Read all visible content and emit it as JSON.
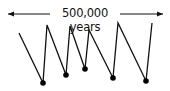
{
  "diagram": {
    "span_label": "500,000 years",
    "arrow": {
      "x1": 8,
      "x2": 163,
      "y": 14
    },
    "line_color": "#111111",
    "polyline": [
      [
        19,
        33
      ],
      [
        43,
        83
      ],
      [
        47,
        25
      ],
      [
        66,
        75
      ],
      [
        70,
        26
      ],
      [
        85,
        69
      ],
      [
        89,
        30
      ],
      [
        113,
        78
      ],
      [
        118,
        23
      ],
      [
        146,
        81
      ],
      [
        152,
        23
      ]
    ],
    "dots": [
      [
        43,
        83
      ],
      [
        66,
        75
      ],
      [
        85,
        69
      ],
      [
        113,
        78
      ],
      [
        146,
        81
      ]
    ]
  }
}
